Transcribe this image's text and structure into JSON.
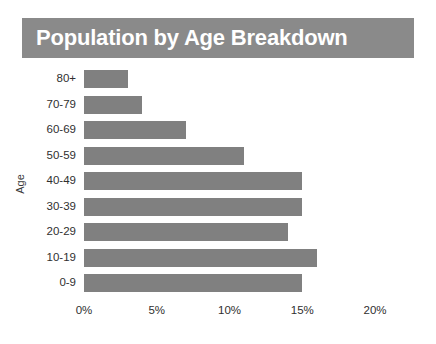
{
  "title": "Population by Age Breakdown",
  "colors": {
    "banner_background": "#8a8a8a",
    "banner_text": "#ffffff",
    "bar": "#808080",
    "page_background": "#ffffff",
    "axis_text": "#2f2f2f"
  },
  "axes": {
    "y_title": "Age",
    "x_ticks": [
      "0%",
      "5%",
      "10%",
      "15%",
      "20%"
    ]
  },
  "chart_data": {
    "type": "bar",
    "orientation": "horizontal",
    "title": "Population by Age Breakdown",
    "xlabel": "",
    "ylabel": "Age",
    "xlim": [
      0,
      20
    ],
    "ylim": null,
    "grid": false,
    "legend": null,
    "x_tick_values": [
      0,
      5,
      10,
      15,
      20
    ],
    "x_tick_labels": [
      "0%",
      "5%",
      "10%",
      "15%",
      "20%"
    ],
    "categories": [
      "80+",
      "70-79",
      "60-69",
      "50-59",
      "40-49",
      "30-39",
      "20-29",
      "10-19",
      "0-9"
    ],
    "values": [
      3,
      4,
      7,
      11,
      15,
      15,
      14,
      16,
      15
    ],
    "value_unit": "%",
    "series": [
      {
        "name": "Population share",
        "values": [
          3,
          4,
          7,
          11,
          15,
          15,
          14,
          16,
          15
        ]
      }
    ]
  }
}
